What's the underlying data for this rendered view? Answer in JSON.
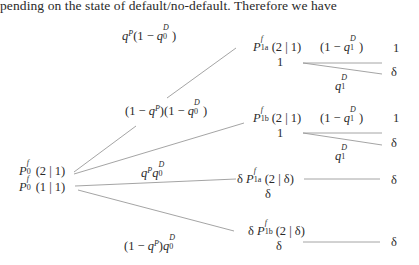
{
  "intro_text": "pending on the state of default/no-default. Therefore we have",
  "tree": {
    "root": {
      "line1": {
        "base": "P",
        "sup": "f",
        "sub": "0",
        "arg": "(2 | 1)"
      },
      "line2": {
        "base": "P",
        "sup": "f",
        "sub": "0",
        "arg": "(1 | 1)"
      }
    },
    "branch_probs": {
      "b1": {
        "q": "q",
        "qsup": "P",
        "rest_open": "(1 − ",
        "qd": "q",
        "qd_sup": "D",
        "qd_sub": "0",
        "rest_close": ")"
      },
      "b2": {
        "pre": "(1 − ",
        "q": "q",
        "qsup": "P",
        "mid": ")(1 − ",
        "qd": "q",
        "qd_sup": "D",
        "qd_sub": "0",
        "post": ")"
      },
      "b3": {
        "q": "q",
        "qsup": "P",
        "qd": "q",
        "qd_sup": "D",
        "qd_sub": "0"
      },
      "b4": {
        "pre": "(1 − ",
        "q": "q",
        "qsup": "P",
        "mid": ")",
        "qd": "q",
        "qd_sup": "D",
        "qd_sub": "0"
      }
    },
    "nodes": {
      "n1a": {
        "base": "P",
        "sup": "f",
        "sub": "1a",
        "arg": "(2 | 1)",
        "below": "1"
      },
      "n1b": {
        "base": "P",
        "sup": "f",
        "sub": "1b",
        "arg": "(2 | 1)",
        "below": "1"
      },
      "n2a": {
        "prefix": "δ ",
        "base": "P",
        "sup": "f",
        "sub": "1a",
        "arg": "(2 | δ)",
        "below": "δ"
      },
      "n2b": {
        "prefix": "δ ",
        "base": "P",
        "sup": "f",
        "sub": "1b",
        "arg": "(2 | δ)",
        "below": "δ"
      }
    },
    "second_stage": {
      "no_default": {
        "pre": "(1 − ",
        "q": "q",
        "sup": "D",
        "sub": "1",
        "post": ")"
      },
      "default": {
        "q": "q",
        "sup": "D",
        "sub": "1"
      }
    },
    "payoffs": {
      "a_top": "1",
      "a_bottom": "δ",
      "b_top": "1",
      "b_bottom": "δ",
      "c": "δ",
      "d": "δ"
    }
  },
  "colors": {
    "text": "#2a2a2a",
    "line": "#9a9a9a"
  }
}
